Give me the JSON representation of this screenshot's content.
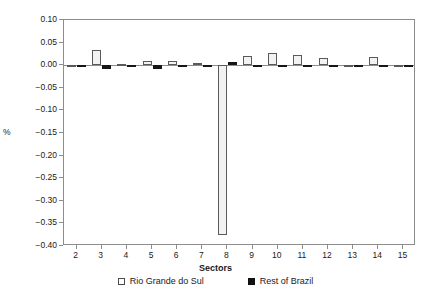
{
  "chart_data": {
    "type": "bar",
    "title": "",
    "xlabel": "Sectors",
    "ylabel": "%",
    "categories": [
      2,
      3,
      4,
      5,
      6,
      7,
      8,
      9,
      10,
      11,
      12,
      13,
      14,
      15
    ],
    "ylim": [
      -0.4,
      0.1
    ],
    "yticks": [
      0.1,
      0.05,
      0.0,
      -0.05,
      -0.1,
      -0.15,
      -0.2,
      -0.25,
      -0.3,
      -0.35,
      -0.4
    ],
    "ytick_labels": [
      "0.10",
      "0.05",
      "0.00",
      "−0.05",
      "−0.10",
      "−0.15",
      "−0.20",
      "−0.25",
      "−0.30",
      "−0.35",
      "−0.40"
    ],
    "xtick_labels": [
      "2",
      "3",
      "4",
      "5",
      "6",
      "7",
      "8",
      "9",
      "10",
      "11",
      "12",
      "13",
      "14",
      "15"
    ],
    "grid": false,
    "legend_position": "bottom",
    "series": [
      {
        "name": "Rio Grande do Sul",
        "color": "#f2f2f2",
        "edge_color": "#5a5a5a",
        "marker": "open-square",
        "values": [
          0.001,
          0.034,
          0.003,
          0.009,
          0.01,
          0.005,
          -0.375,
          0.021,
          0.028,
          0.022,
          0.015,
          0.0,
          0.019,
          0.0
        ]
      },
      {
        "name": "Rest of Brazil",
        "color": "#161616",
        "edge_color": "#161616",
        "marker": "filled-square",
        "values": [
          -0.002,
          -0.009,
          -0.002,
          -0.008,
          -0.003,
          -0.002,
          0.006,
          -0.002,
          -0.002,
          -0.002,
          -0.002,
          -0.003,
          -0.002,
          0.0
        ]
      }
    ]
  },
  "legend": {
    "items": [
      {
        "label": "Rio Grande do Sul",
        "marker": "open-square"
      },
      {
        "label": "Rest of Brazil",
        "marker": "filled-square"
      }
    ]
  }
}
